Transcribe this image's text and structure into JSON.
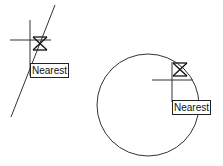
{
  "left_example": {
    "snap_label": "Nearest",
    "object": "line"
  },
  "right_example": {
    "snap_label": "Nearest",
    "object": "circle"
  },
  "colors": {
    "stroke": "#333333",
    "background": "#ffffff"
  }
}
